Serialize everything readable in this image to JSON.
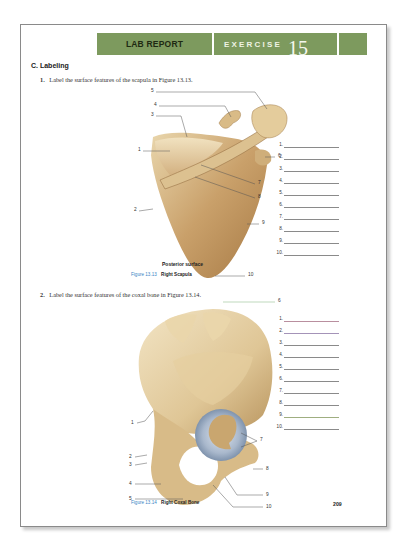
{
  "header": {
    "lab_report": "LAB REPORT",
    "exercise_label": "EXERCISE",
    "exercise_number": "15",
    "bar_color": "#7d9a5e"
  },
  "section": {
    "title": "C.  Labeling"
  },
  "questions": [
    {
      "number": "1.",
      "text": "Label the surface features of the scapula in Figure 13.13.",
      "figure": {
        "subtitle": "Posterior surface",
        "caption_number": "Figure 13.13",
        "caption_title": "Right Scapula",
        "callouts": [
          "1",
          "2",
          "3",
          "4",
          "5",
          "6",
          "7",
          "8",
          "9",
          "10"
        ]
      },
      "answers": [
        {
          "num": "1.",
          "value": ""
        },
        {
          "num": "2.",
          "value": ""
        },
        {
          "num": "3.",
          "value": ""
        },
        {
          "num": "4.",
          "value": ""
        },
        {
          "num": "5.",
          "value": ""
        },
        {
          "num": "6.",
          "value": ""
        },
        {
          "num": "7.",
          "value": ""
        },
        {
          "num": "8.",
          "value": ""
        },
        {
          "num": "9.",
          "value": ""
        },
        {
          "num": "10.",
          "value": ""
        }
      ]
    },
    {
      "number": "2.",
      "text": "Label the surface features of the coxal bone in Figure 13.14.",
      "figure": {
        "caption_number": "Figure 13.14",
        "caption_title": "Right Coxal Bone",
        "callouts": [
          "1",
          "2",
          "3",
          "4",
          "5",
          "6",
          "7",
          "8",
          "9",
          "10"
        ]
      },
      "answers": [
        {
          "num": "1.",
          "value": "",
          "line_color": "#b98f9f"
        },
        {
          "num": "2.",
          "value": "",
          "line_color": "#a493b8"
        },
        {
          "num": "3.",
          "value": "",
          "line_color": "#8a8a8a"
        },
        {
          "num": "4.",
          "value": "",
          "line_color": "#8a8a8a"
        },
        {
          "num": "5.",
          "value": "",
          "line_color": "#8a8a8a"
        },
        {
          "num": "6.",
          "value": "",
          "line_color": "#8a8a8a"
        },
        {
          "num": "7.",
          "value": "",
          "line_color": "#8a8a8a"
        },
        {
          "num": "8.",
          "value": "",
          "line_color": "#8a8a8a"
        },
        {
          "num": "9.",
          "value": "",
          "line_color": "#9fae80"
        },
        {
          "num": "10.",
          "value": "",
          "line_color": "#8a8a8a"
        }
      ]
    }
  ],
  "page_number": "209"
}
